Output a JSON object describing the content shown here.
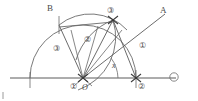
{
  "figure": {
    "type": "compass-and-straightedge geometric construction",
    "stroke_color": "#5a5a5a",
    "background_color": "#ffffff",
    "baseline": {
      "name": "horizontal-base-line",
      "x1": 10,
      "y1": 78,
      "x2": 176,
      "y2": 78
    },
    "points": [
      {
        "name": "origin-vertex",
        "label": "O",
        "x": 83,
        "y": 78
      },
      {
        "name": "point-step-two",
        "label": "②",
        "x": 136,
        "y": 78
      },
      {
        "name": "point-step-three",
        "label": "③",
        "x": 113,
        "y": 20
      },
      {
        "name": "point-b-arc",
        "label": "B",
        "x": 59,
        "y": 25
      }
    ],
    "labels": [
      {
        "name": "label-ray-a",
        "text": "A",
        "x": 160,
        "y": 8,
        "style": "roman"
      },
      {
        "name": "label-ray-b",
        "text": "B",
        "x": 47,
        "y": 6,
        "style": "roman"
      },
      {
        "name": "label-step-three",
        "text": "③",
        "x": 108,
        "y": 10,
        "style": "circ"
      },
      {
        "name": "label-step-one-right",
        "text": "①",
        "x": 140,
        "y": 44,
        "style": "circ"
      },
      {
        "name": "label-step-two-mid",
        "text": "②",
        "x": 86,
        "y": 38,
        "style": "circ"
      },
      {
        "name": "label-step-three-left",
        "text": "③",
        "x": 54,
        "y": 47,
        "style": "circ"
      },
      {
        "name": "label-step-one-base",
        "text": "①",
        "x": 73,
        "y": 83,
        "style": "circ"
      },
      {
        "name": "label-origin",
        "text": "O",
        "x": 84,
        "y": 84,
        "style": "o"
      },
      {
        "name": "label-step-two-base",
        "text": "②",
        "x": 139,
        "y": 84,
        "style": "circ"
      },
      {
        "name": "label-angle-x",
        "text": "x",
        "x": 113,
        "y": 64,
        "style": "ital"
      },
      {
        "name": "label-line-end",
        "text": "⑮",
        "x": 171,
        "y": 74,
        "style": "circ"
      }
    ],
    "arcs": [
      {
        "name": "arc-step-one-large",
        "desc": "large semicircular arc centred at O through B and ②"
      },
      {
        "name": "arc-step-two",
        "desc": "arc centred at ② through ③"
      },
      {
        "name": "arc-step-three",
        "desc": "arc centred at B through ③"
      }
    ],
    "segments": [
      {
        "name": "segment-o-to-step-three",
        "desc": "O to ③"
      },
      {
        "name": "segment-o-to-b",
        "desc": "O to B"
      },
      {
        "name": "segment-o-to-ray-a",
        "desc": "O through ③ extended to A"
      },
      {
        "name": "segment-b-to-step-three",
        "desc": "B to ③ horizontal chord"
      },
      {
        "name": "segment-step-three-to-step-two",
        "desc": "③ to ②"
      }
    ],
    "angle_marker": {
      "name": "angle-x-marker",
      "vertex": "O",
      "label": "x"
    }
  }
}
